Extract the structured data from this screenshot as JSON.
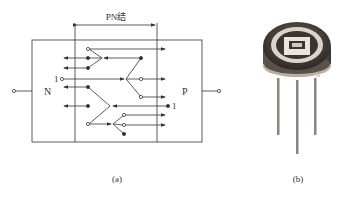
{
  "figure_a": {
    "junction_label": "PN结",
    "n_label": "N",
    "p_label": "P",
    "marker_left": "1",
    "marker_right": "1",
    "caption": "(a)"
  },
  "figure_b": {
    "caption": "(b)",
    "subject": "photodiode-component"
  },
  "colors": {
    "line": "#333333",
    "can_dark": "#4a4540",
    "can_ring": "#d9d4cc",
    "leads": "#8a8580"
  }
}
